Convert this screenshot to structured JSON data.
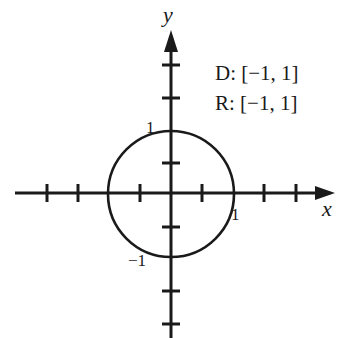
{
  "diagram": {
    "type": "graph-of-relation",
    "shape": "unit circle",
    "axes": {
      "x_label": "x",
      "y_label": "y"
    },
    "tick_labels": {
      "x_pos": "1",
      "y_pos": "1",
      "y_neg": "−1"
    },
    "domain_text": "D: [−1, 1]",
    "range_text": "R: [−1, 1]",
    "center": [
      0,
      0
    ],
    "radius": 1,
    "x_ticks": [
      -4,
      -3,
      -2,
      -1,
      1,
      2,
      3,
      4
    ],
    "y_ticks": [
      -4,
      -3,
      -2,
      -1,
      1,
      2,
      3,
      4
    ],
    "colors": {
      "stroke": "#1a1a1a",
      "background": "#ffffff"
    }
  }
}
